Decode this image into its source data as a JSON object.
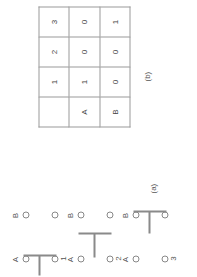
{
  "figure": {
    "orientation_note": "rotated-90-ccw",
    "panels": [
      {
        "caption": "(a)",
        "type": "node-diagrams",
        "column_labels": [
          "A",
          "B"
        ],
        "diagrams": [
          {
            "number": "1",
            "bar_column": "A"
          },
          {
            "number": "2",
            "bar_column": "between"
          },
          {
            "number": "3",
            "bar_column": "B"
          }
        ]
      },
      {
        "caption": "(b)",
        "type": "matrix-table"
      }
    ]
  },
  "panel_a": {
    "caption": "(a)",
    "labels": {
      "a": "A",
      "b": "B"
    },
    "rows": [
      {
        "number": "1",
        "col_a": "A",
        "col_b": "B"
      },
      {
        "number": "2",
        "col_a": "A",
        "col_b": "B"
      },
      {
        "number": "3",
        "col_a": "A",
        "col_b": "B"
      }
    ]
  },
  "panel_b": {
    "caption": "(b)",
    "table": {
      "header": [
        "",
        "1",
        "2",
        "3"
      ],
      "rows": [
        [
          "A",
          "1",
          "0",
          "0"
        ],
        [
          "B",
          "0",
          "0",
          "1"
        ]
      ]
    }
  },
  "colors": {
    "background": "#ffffff",
    "line": "#8a8a8a",
    "border": "#9a9a9a",
    "text": "#444444"
  }
}
